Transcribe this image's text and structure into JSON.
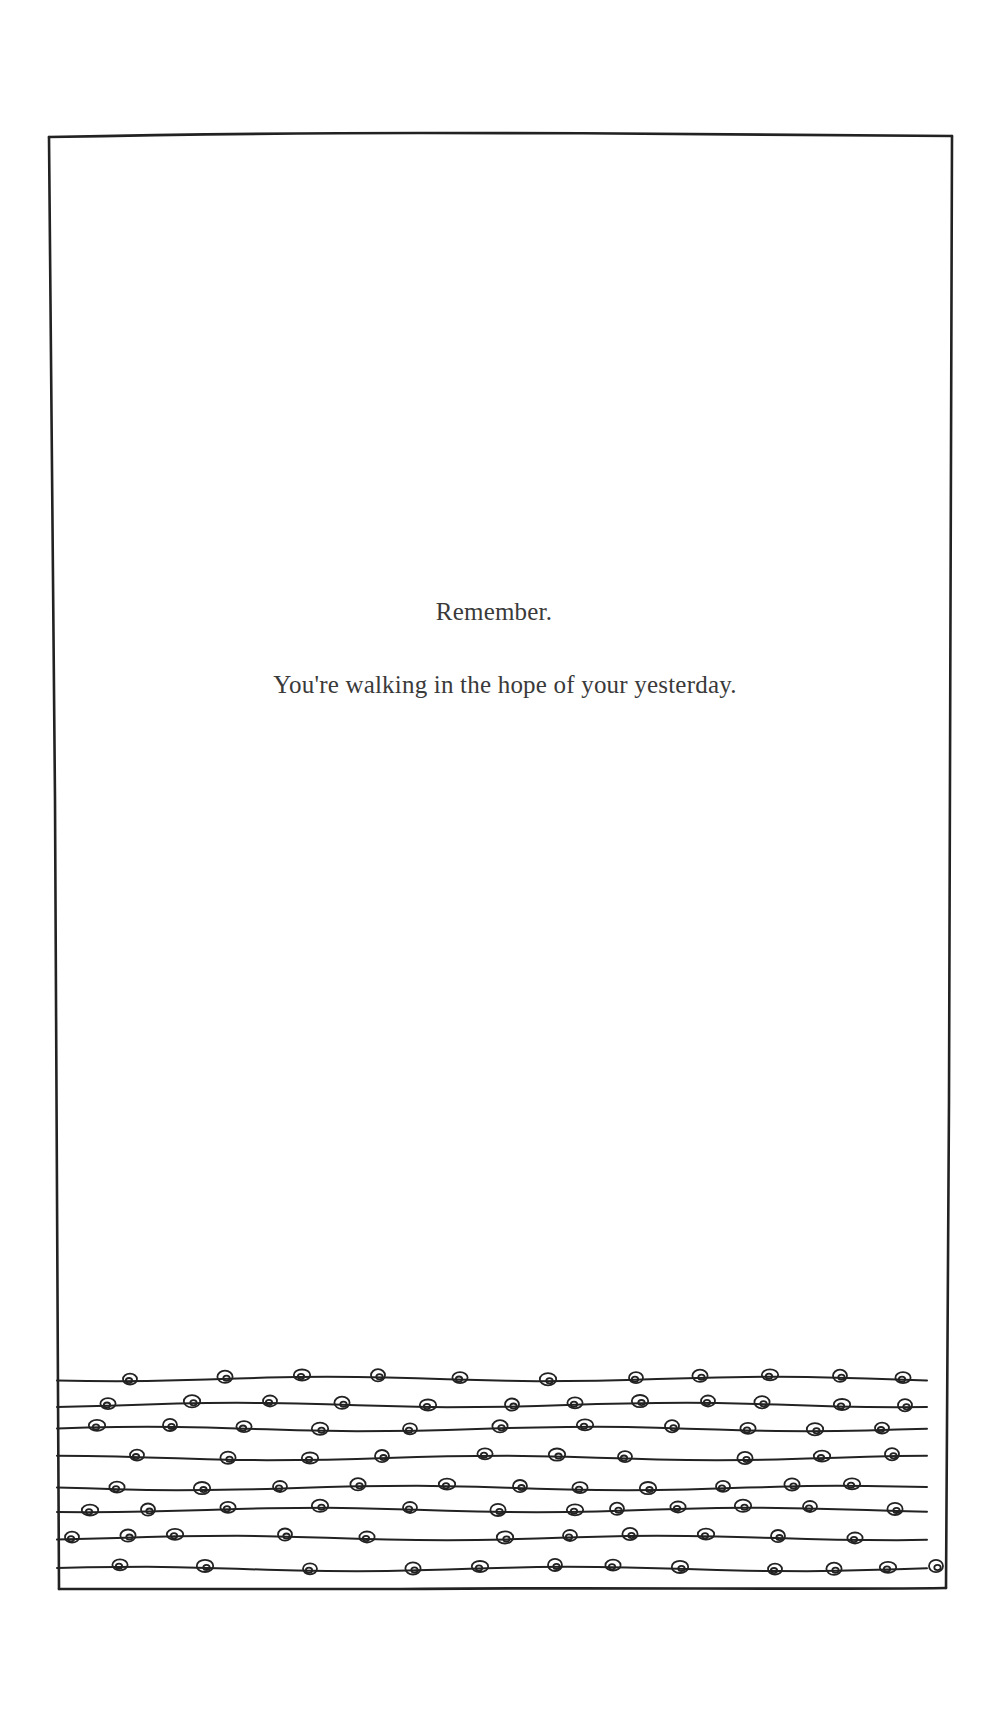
{
  "page": {
    "background": "#ffffff",
    "ink_color": "#222222",
    "text_color": "#3a3a3a"
  },
  "poem": {
    "lines": [
      "Remember.",
      "You're walking in the hope of your yesterday."
    ]
  },
  "illustration": {
    "description": "hand-drawn rectangular frame with eight wavy horizontal lines of small spiral knots along the bottom",
    "frame": {
      "top_left": [
        49,
        137
      ],
      "top_right": [
        952,
        136
      ],
      "bottom_right": [
        946,
        1588
      ],
      "bottom_left": [
        59,
        1589
      ]
    },
    "strand_count": 8,
    "strands": [
      {
        "y": 1379,
        "knots_x": [
          130,
          225,
          302,
          378,
          460,
          548,
          636,
          700,
          770,
          840,
          903
        ]
      },
      {
        "y": 1405,
        "knots_x": [
          108,
          192,
          270,
          342,
          428,
          512,
          575,
          640,
          708,
          762,
          842,
          905
        ]
      },
      {
        "y": 1429,
        "knots_x": [
          97,
          170,
          244,
          320,
          410,
          500,
          585,
          672,
          748,
          815,
          882
        ]
      },
      {
        "y": 1458,
        "knots_x": [
          137,
          228,
          310,
          382,
          485,
          557,
          625,
          745,
          822,
          892
        ]
      },
      {
        "y": 1488,
        "knots_x": [
          117,
          202,
          280,
          358,
          447,
          520,
          580,
          648,
          723,
          792,
          852
        ]
      },
      {
        "y": 1510,
        "knots_x": [
          90,
          148,
          228,
          320,
          410,
          498,
          575,
          617,
          678,
          743,
          810,
          895
        ]
      },
      {
        "y": 1538,
        "knots_x": [
          72,
          128,
          175,
          285,
          367,
          505,
          570,
          630,
          706,
          778,
          855
        ]
      },
      {
        "y": 1569,
        "knots_x": [
          120,
          205,
          310,
          413,
          480,
          555,
          613,
          680,
          775,
          834,
          888,
          936
        ]
      }
    ]
  }
}
